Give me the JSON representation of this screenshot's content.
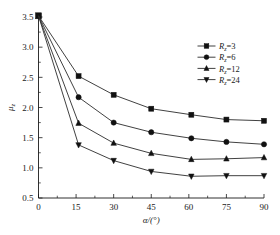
{
  "chart_data": {
    "type": "line",
    "title": "",
    "xlabel": "α/(°)",
    "ylabel": "μ",
    "ylabel_sub": "z",
    "xlim": [
      0,
      90
    ],
    "ylim": [
      0.5,
      3.5
    ],
    "xticks": [
      0,
      15,
      30,
      45,
      60,
      75,
      90
    ],
    "xtick_labels": [
      "0",
      "15",
      "30",
      "45",
      "60",
      "75",
      "90"
    ],
    "yticks": [
      0.5,
      1.0,
      1.5,
      2.0,
      2.5,
      3.0,
      3.5
    ],
    "ytick_labels": [
      "0.5",
      "1.0",
      "1.5",
      "2.0",
      "2.5",
      "3.0",
      "3.5"
    ],
    "grid": false,
    "legend_position": "upper-right",
    "x": [
      0,
      16,
      30,
      45,
      61,
      75,
      90
    ],
    "series": [
      {
        "name": "R_z=3",
        "label_base": "R",
        "label_sub": "z",
        "label_value": "=3",
        "marker": "square",
        "color": "#111111",
        "values": [
          3.52,
          2.52,
          2.21,
          1.98,
          1.88,
          1.8,
          1.78
        ]
      },
      {
        "name": "R_z=6",
        "label_base": "R",
        "label_sub": "z",
        "label_value": "=6",
        "marker": "circle",
        "color": "#111111",
        "values": [
          3.52,
          2.17,
          1.75,
          1.59,
          1.49,
          1.43,
          1.39
        ]
      },
      {
        "name": "R_z=12",
        "label_base": "R",
        "label_sub": "z",
        "label_value": "=12",
        "marker": "triangle-up",
        "color": "#111111",
        "values": [
          3.52,
          1.74,
          1.41,
          1.24,
          1.14,
          1.15,
          1.17
        ]
      },
      {
        "name": "R_z=24",
        "label_base": "R",
        "label_sub": "z",
        "label_value": "=24",
        "marker": "triangle-down",
        "color": "#111111",
        "values": [
          3.52,
          1.38,
          1.12,
          0.94,
          0.86,
          0.87,
          0.87
        ]
      }
    ]
  }
}
